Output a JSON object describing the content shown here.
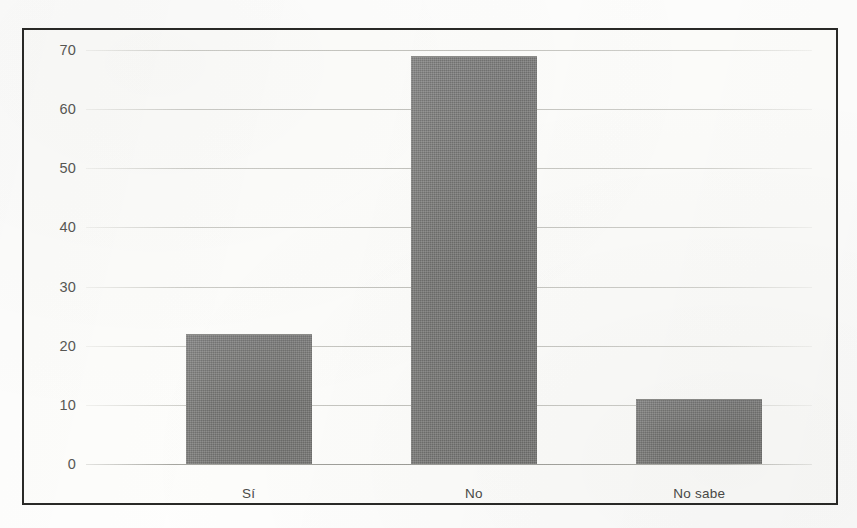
{
  "chart_data": {
    "type": "bar",
    "title": "",
    "subtitle": "",
    "xlabel": "",
    "ylabel": "",
    "categories": [
      "Sí",
      "No",
      "No sabe"
    ],
    "values": [
      22,
      69,
      11
    ],
    "series": [
      {
        "name": "Respuestas",
        "values": [
          22,
          69,
          11
        ]
      }
    ],
    "ylim": [
      0,
      70
    ],
    "yticks": [
      0,
      10,
      20,
      30,
      40,
      50,
      60,
      70
    ],
    "ytick_labels": [
      "0",
      "10",
      "20",
      "30",
      "40",
      "50",
      "60",
      "70"
    ],
    "grid": true,
    "grid_axis": "y",
    "legend": false,
    "legend_position": "none",
    "annotations": [],
    "bar_color": "#7b7b79",
    "gridline_color": "#b4b4ae",
    "axis_label_color": "#585854",
    "frame_color": "#2a2a28",
    "background_color": "#fdfdfb"
  }
}
